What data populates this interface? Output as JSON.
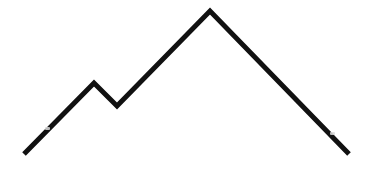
{
  "figure": {
    "type": "line-drawing",
    "width": 373,
    "height": 173,
    "background": "#ffffff",
    "stroke_color": "#111111",
    "stroke_width": 5,
    "points": [
      {
        "x": 24,
        "y": 154
      },
      {
        "x": 94,
        "y": 83
      },
      {
        "x": 117,
        "y": 106
      },
      {
        "x": 210,
        "y": 11
      },
      {
        "x": 349,
        "y": 154
      }
    ],
    "artifacts": [
      {
        "x": 45,
        "y": 127
      },
      {
        "x": 330,
        "y": 132
      }
    ]
  }
}
